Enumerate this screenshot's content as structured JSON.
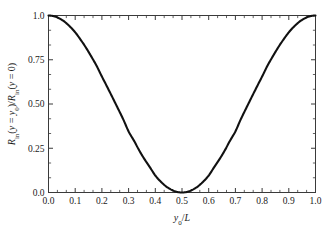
{
  "chart_data": {
    "type": "line",
    "title": "",
    "subtitle": "",
    "xlabel": "y0/L",
    "ylabel": "Rin(y = y0)/Rin(y = 0)",
    "xlabel_parts": {
      "var": "y",
      "sub": "0",
      "slash": "/",
      "denom": "L"
    },
    "ylabel_parts": {
      "r1": "R",
      "r1sub": "in",
      "open1": "(",
      "y1": "y",
      "eq1": " = ",
      "y0": "y",
      "y0sub": "0",
      "close1": ")",
      "slash": "/",
      "r2": "R",
      "r2sub": "in",
      "open2": "(",
      "y2": "y",
      "eq2": " = 0",
      "close2": ")"
    },
    "xlim": [
      0.0,
      1.0
    ],
    "ylim": [
      0.0,
      1.0
    ],
    "xticks": [
      0.0,
      0.1,
      0.2,
      0.3,
      0.4,
      0.5,
      0.6,
      0.7,
      0.8,
      0.9,
      1.0
    ],
    "xticklabels": [
      "0.0",
      "0.1",
      "0.2",
      "0.3",
      "0.4",
      "0.5",
      "0.6",
      "0.7",
      "0.8",
      "0.9",
      "1.0"
    ],
    "yticks": [
      0.0,
      0.25,
      0.5,
      0.75,
      1.0
    ],
    "yticklabels": [
      "0.0",
      "0.25",
      "0.50",
      "0.75",
      "1.0"
    ],
    "x_minor_per_interval": 2,
    "y_minor_per_interval": 2,
    "grid": false,
    "legend": false,
    "legend_position": "none",
    "frame": "box",
    "tick_direction": "in",
    "series": [
      {
        "name": "Rin ratio",
        "color": "#111111",
        "linewidth": 2.1,
        "function": "cos^2(pi*x)",
        "x": [
          0.0,
          0.02,
          0.04,
          0.06,
          0.08,
          0.1,
          0.12,
          0.14,
          0.16,
          0.18,
          0.2,
          0.22,
          0.24,
          0.26,
          0.28,
          0.3,
          0.32,
          0.34,
          0.36,
          0.38,
          0.4,
          0.42,
          0.44,
          0.46,
          0.48,
          0.5,
          0.52,
          0.54,
          0.56,
          0.58,
          0.6,
          0.62,
          0.64,
          0.66,
          0.68,
          0.7,
          0.72,
          0.74,
          0.76,
          0.78,
          0.8,
          0.82,
          0.84,
          0.86,
          0.88,
          0.9,
          0.92,
          0.94,
          0.96,
          0.98,
          1.0
        ],
        "y": [
          1.0,
          0.996,
          0.984,
          0.965,
          0.938,
          0.905,
          0.864,
          0.819,
          0.769,
          0.716,
          0.655,
          0.596,
          0.536,
          0.475,
          0.413,
          0.345,
          0.293,
          0.237,
          0.187,
          0.142,
          0.096,
          0.062,
          0.035,
          0.016,
          0.004,
          0.0,
          0.004,
          0.016,
          0.035,
          0.062,
          0.096,
          0.142,
          0.187,
          0.237,
          0.293,
          0.345,
          0.413,
          0.475,
          0.536,
          0.596,
          0.655,
          0.716,
          0.769,
          0.819,
          0.864,
          0.905,
          0.938,
          0.965,
          0.984,
          0.996,
          1.0
        ]
      }
    ],
    "annotations": []
  }
}
